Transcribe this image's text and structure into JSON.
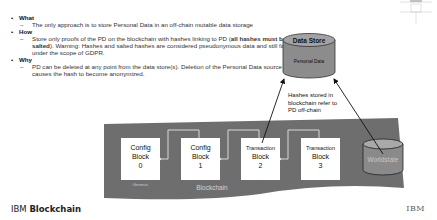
{
  "bullets": [
    {
      "heading": "What",
      "items": [
        {
          "text": "The only approach is to store Personal Data in an off-chain mutable data storage"
        }
      ]
    },
    {
      "heading": "How",
      "items": [
        {
          "pre": "Store only proofs of the PD on the blockchain with hashes linking to PD (",
          "bold": "all hashes must be salted",
          "post": "). Warning: Hashes and salted hashes are considered pseudonymous data and still fall under the scope of GDPR."
        }
      ]
    },
    {
      "heading": "Why",
      "items": [
        {
          "text": "PD can be deleted at any point from the data store(s). Deletion of the Personal Data source causes the hash to become anonymized."
        }
      ]
    }
  ],
  "diagram": {
    "data_store": {
      "title": "Data Store",
      "subtitle": "Personal Data"
    },
    "annotation": [
      "Hashes stored in",
      "blockchain refer to",
      "PD off-chain"
    ],
    "blocks": [
      {
        "lines": [
          "Config",
          "Block",
          "0"
        ],
        "caption": "Genesis"
      },
      {
        "lines": [
          "Config",
          "Block",
          "1"
        ]
      },
      {
        "lines": [
          "Transaction",
          "Block",
          "2"
        ]
      },
      {
        "lines": [
          "Transaction",
          "Block",
          "3"
        ]
      }
    ],
    "worldstate": "Worldstate",
    "blockchain_label": "Blockchain",
    "colors": {
      "band": "#6e6e6e",
      "block": "#ffffff",
      "cylinder": "#8a8a8a",
      "cylinder_top": "#a9a9a9"
    }
  },
  "footer": {
    "brand_light": "IBM ",
    "brand_bold": "Blockchain",
    "logo": "IBM"
  }
}
